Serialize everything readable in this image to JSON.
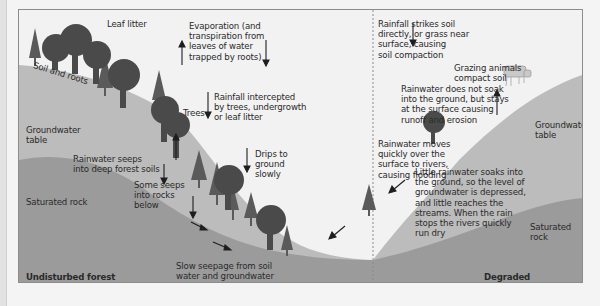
{
  "diagram": {
    "left_panel": {
      "title": "Undisturbed forest",
      "labels": {
        "leaf_litter": "Leaf litter",
        "soil_roots": "Soil and roots",
        "evaporation": "Evaporation (and\ntranspiration from\nleaves of water\ntrapped by roots)",
        "rainfall_intercepted": "Rainfall intercepted\nby trees, undergrowth\nor leaf litter",
        "trees": "Trees",
        "groundwater_table": "Groundwater\ntable",
        "drips": "Drips to\nground\nslowly",
        "rainwater_seeps": "Rainwater seeps\ninto deep forest soils",
        "some_seeps": "Some seeps\ninto rocks\nbelow",
        "saturated_rock": "Saturated rock",
        "slow_seepage": "Slow seepage from soil\nwater and groundwater\nfeeds perennial river"
      }
    },
    "right_panel": {
      "title": "Degraded “forested” slope",
      "labels": {
        "rainfall_strikes": "Rainfall strikes soil\ndirectly, or grass near\nsurface, causing\nsoil compaction",
        "grazing": "Grazing animals\ncompact soil",
        "no_soak": "Rainwater does not soak\ninto the ground, but stays\nat the surface causing\nrunoff and erosion",
        "groundwater_table": "Groundwater\ntable",
        "moves_quickly": "Rainwater moves\nquickly over the\nsurface to rivers,\ncausing flooding",
        "little_soaks": "Little rainwater soaks into\nthe ground, so the level of\ngroundwater is depressed,\nand little reaches the\nstreams. When the rain\nstops the rivers quickly\nrun dry",
        "saturated_rock": "Saturated rock"
      }
    },
    "colors": {
      "background": "#f2f2f2",
      "soil": "#bcbcbc",
      "rock": "#9b9b9b",
      "tree_dark": "#4a4a4a",
      "tree_mid": "#606060",
      "text": "#2a2a2a"
    }
  }
}
